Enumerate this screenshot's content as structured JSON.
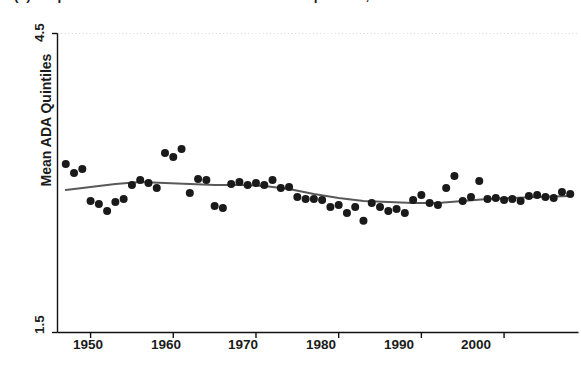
{
  "chart_data": {
    "type": "scatter",
    "title": "(a) Proportion of House Members' Mean ADA quintiles, 1945-2008",
    "xlabel": "",
    "ylabel": "Mean ADA Quintiles",
    "xlim": [
      1946.0,
      2009.0
    ],
    "ylim": [
      1.5,
      4.5
    ],
    "xticks": [
      1950,
      1960,
      1970,
      1980,
      1990,
      2000
    ],
    "xtick_labels": [
      "1950",
      "1960",
      "1970",
      "1980",
      "1990",
      "2000"
    ],
    "yticks": [
      1.5,
      4.5
    ],
    "ytick_labels": [
      "1.5",
      "4.5"
    ],
    "grid": "dotted-horizontal-at-yticks",
    "legend": "none",
    "marker_color": "#1a1a1a",
    "marker_size_px": 8,
    "line_color": "#595959",
    "series": [
      {
        "name": "Mean ADA Quintiles (biennial observations)",
        "type": "scatter",
        "x": [
          1947,
          1948,
          1949,
          1950,
          1951,
          1952,
          1953,
          1954,
          1955,
          1956,
          1957,
          1958,
          1959,
          1960,
          1961,
          1962,
          1963,
          1964,
          1965,
          1966,
          1967,
          1968,
          1969,
          1970,
          1971,
          1972,
          1973,
          1974,
          1975,
          1976,
          1977,
          1978,
          1979,
          1980,
          1981,
          1982,
          1983,
          1984,
          1985,
          1986,
          1987,
          1988,
          1989,
          1990,
          1991,
          1992,
          1993,
          1994,
          1995,
          1996,
          1997,
          1998,
          1999,
          2000,
          2001,
          2002,
          2003,
          2004,
          2005,
          2006,
          2007,
          2008
        ],
        "y": [
          3.19,
          3.1,
          3.14,
          2.82,
          2.79,
          2.72,
          2.81,
          2.84,
          2.98,
          3.03,
          3.0,
          2.95,
          3.3,
          3.26,
          3.34,
          2.9,
          3.04,
          3.03,
          2.77,
          2.75,
          2.99,
          3.01,
          2.98,
          3.0,
          2.98,
          3.03,
          2.95,
          2.96,
          2.86,
          2.84,
          2.84,
          2.83,
          2.76,
          2.78,
          2.7,
          2.76,
          2.62,
          2.8,
          2.76,
          2.72,
          2.74,
          2.7,
          2.83,
          2.88,
          2.8,
          2.78,
          2.95,
          3.07,
          2.82,
          2.86,
          3.02,
          2.84,
          2.85,
          2.83,
          2.84,
          2.82,
          2.87,
          2.88,
          2.86,
          2.85,
          2.91,
          2.89
        ]
      },
      {
        "name": "Lowess smooth",
        "type": "line",
        "x": [
          1947,
          1950,
          1953,
          1956,
          1959,
          1962,
          1965,
          1968,
          1971,
          1974,
          1977,
          1980,
          1983,
          1986,
          1989,
          1992,
          1995,
          1998,
          2001,
          2004,
          2008
        ],
        "y": [
          2.93,
          2.96,
          2.99,
          3.01,
          3.0,
          2.99,
          2.98,
          2.98,
          2.97,
          2.94,
          2.89,
          2.85,
          2.82,
          2.81,
          2.8,
          2.8,
          2.82,
          2.84,
          2.85,
          2.86,
          2.87
        ]
      }
    ]
  },
  "axis": {
    "y_top_label": "4.5",
    "y_bottom_label": "1.5",
    "y_title": "Mean ADA Quintiles",
    "x_labels": [
      "1950",
      "1960",
      "1970",
      "1980",
      "1990",
      "2000"
    ]
  },
  "title": {
    "text": "(a) Proportion of House Members' Mean ADA quintiles, 1945-2008"
  }
}
